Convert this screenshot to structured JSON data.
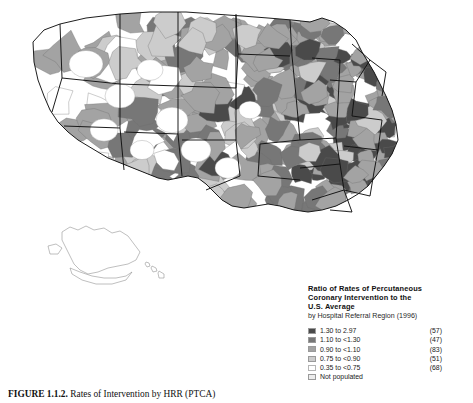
{
  "figure": {
    "caption_number": "FIGURE 1.1.2.",
    "caption_text": "Rates of Intervention by HRR (PTCA)"
  },
  "legend": {
    "title_line1": "Ratio of Rates of Percutaneous",
    "title_line2": "Coronary Intervention to the",
    "title_line3": "U.S. Average",
    "subtitle": "by Hospital Referral Region (1996)",
    "rows": [
      {
        "label": "1.30 to 2.97",
        "count": "(57)",
        "color": "#4a4a4a",
        "name": "class-1-30-to-2-97"
      },
      {
        "label": "1.10 to <1.30",
        "count": "(47)",
        "color": "#777777",
        "name": "class-1-10-to-1-30"
      },
      {
        "label": "0.90 to <1.10",
        "count": "(83)",
        "color": "#a3a3a3",
        "name": "class-0-90-to-1-10"
      },
      {
        "label": "0.75 to <0.90",
        "count": "(51)",
        "color": "#cccccc",
        "name": "class-0-75-to-0-90"
      },
      {
        "label": "0.35 to <0.75",
        "count": "(68)",
        "color": "#ffffff",
        "name": "class-0-35-to-0-75"
      },
      {
        "label": "Not populated",
        "count": "",
        "color": "#ececec",
        "name": "class-not-populated"
      }
    ]
  },
  "chart_data": {
    "type": "map",
    "map_kind": "choropleth",
    "title": "Ratio of Rates of Percutaneous Coronary Intervention to the U.S. Average",
    "subtitle": "by Hospital Referral Region (1996)",
    "unit_of_analysis": "Hospital Referral Region",
    "year": 1996,
    "region": "United States",
    "insets": [
      "Alaska",
      "Hawaii"
    ],
    "value_range": [
      0.35,
      2.97
    ],
    "legend_position": "bottom-right",
    "classes": [
      {
        "label": "1.30 to 2.97",
        "min": 1.3,
        "max": 2.97,
        "count": 57,
        "color": "#4a4a4a"
      },
      {
        "label": "1.10 to <1.30",
        "min": 1.1,
        "max": 1.3,
        "count": 47,
        "color": "#777777"
      },
      {
        "label": "0.90 to <1.10",
        "min": 0.9,
        "max": 1.1,
        "count": 83,
        "color": "#a3a3a3"
      },
      {
        "label": "0.75 to <0.90",
        "min": 0.75,
        "max": 0.9,
        "count": 51,
        "color": "#cccccc"
      },
      {
        "label": "0.35 to <0.75",
        "min": 0.35,
        "max": 0.75,
        "count": 68,
        "color": "#ffffff"
      },
      {
        "label": "Not populated",
        "min": null,
        "max": null,
        "count": null,
        "color": "#ececec"
      }
    ],
    "total_regions": 306
  },
  "palette": {
    "c1": "#4a4a4a",
    "c2": "#777777",
    "c3": "#a3a3a3",
    "c4": "#cccccc",
    "c5": "#ffffff",
    "c6": "#ececec",
    "state_border": "#111111",
    "hrr_border": "#6f6f6f",
    "background": "#ffffff"
  }
}
